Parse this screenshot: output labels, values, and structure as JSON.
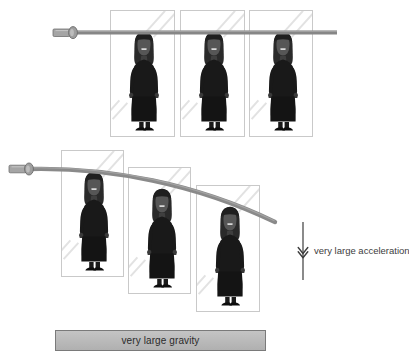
{
  "diagram": {
    "background_color": "#ffffff"
  },
  "scenes": [
    {
      "id": "top-scene",
      "name": "straight-rod-scene",
      "description": "Straight horizontal rod with three standing figures in glass panels",
      "rod": {
        "name": "straight-rod",
        "shape": "straight",
        "color": "#808080",
        "handle_color": "#9b9b9b",
        "handle_outline": "#6d6d6d"
      },
      "panels": [
        {
          "label": "panel-1",
          "x": 110,
          "y": 10,
          "w": 65,
          "h": 127
        },
        {
          "label": "panel-2",
          "x": 180,
          "y": 10,
          "w": 65,
          "h": 127
        },
        {
          "label": "panel-3",
          "x": 249,
          "y": 10,
          "w": 64,
          "h": 127
        }
      ],
      "figures": [
        {
          "label": "person-1",
          "x": 128,
          "y": 31,
          "scale": 1.0
        },
        {
          "label": "person-2",
          "x": 198,
          "y": 31,
          "scale": 1.0
        },
        {
          "label": "person-3",
          "x": 267,
          "y": 31,
          "scale": 1.0
        }
      ]
    },
    {
      "id": "bottom-scene",
      "name": "bent-rod-scene",
      "description": "Sagging curved rod with three figures stepped downward in glass panels",
      "rod": {
        "name": "bent-rod",
        "shape": "curved",
        "color": "#808080",
        "handle_color": "#9b9b9b",
        "handle_outline": "#6d6d6d"
      },
      "panels": [
        {
          "label": "panel-1",
          "x": 61,
          "y": 150,
          "w": 63,
          "h": 127
        },
        {
          "label": "panel-2",
          "x": 128,
          "y": 167,
          "w": 63,
          "h": 127
        },
        {
          "label": "panel-3",
          "x": 196,
          "y": 185,
          "w": 64,
          "h": 127
        }
      ],
      "figures": [
        {
          "label": "person-1",
          "x": 78,
          "y": 171,
          "scale": 1.0
        },
        {
          "label": "person-2",
          "x": 146,
          "y": 188,
          "scale": 1.0
        },
        {
          "label": "person-3",
          "x": 214,
          "y": 206,
          "scale": 1.0
        }
      ]
    }
  ],
  "annotations": {
    "acceleration": {
      "label": "very large acceleration",
      "icon": "down-arrow-icon",
      "direction": "down",
      "color": "#3d3d3d",
      "x": 296,
      "y": 222,
      "arrow_height": 58
    },
    "gravity_bar": {
      "label": "very large gravity",
      "fill_color": "#bcbcbc",
      "border_color": "#7a7a7a",
      "x": 55,
      "y": 330,
      "w": 211,
      "h": 21
    }
  },
  "figure_colors": {
    "body": "#191919",
    "hair": "#2a2a2a",
    "face": "#4a4a4a",
    "skirt": "#141414",
    "shoes": "#0d0d0d"
  }
}
